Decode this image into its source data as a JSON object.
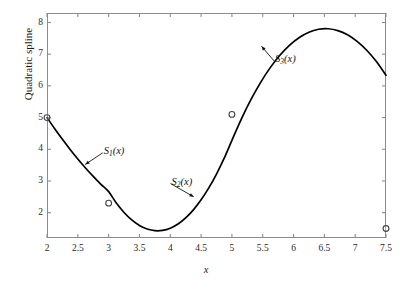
{
  "chart_data": {
    "type": "line",
    "title": "",
    "subtitle": "",
    "xlabel": "x",
    "ylabel": "Quadratic spline",
    "xlim": [
      2,
      7.5
    ],
    "ylim": [
      1.2,
      8.3
    ],
    "grid": false,
    "legend": null,
    "x_ticks": [
      "2",
      "2.5",
      "3",
      "3.5",
      "4",
      "4.5",
      "5",
      "5.5",
      "6",
      "6.5",
      "7",
      "7.5"
    ],
    "x_tick_values": [
      2,
      2.5,
      3,
      3.5,
      4,
      4.5,
      5,
      5.5,
      6,
      6.5,
      7,
      7.5
    ],
    "y_ticks": [
      "2",
      "3",
      "4",
      "5",
      "6",
      "7",
      "8"
    ],
    "y_tick_values": [
      2,
      3,
      4,
      5,
      6,
      7,
      8
    ],
    "series": [
      {
        "name": "Quadratic spline curve",
        "type": "line",
        "color": "#000000",
        "x": [
          2.0,
          2.125,
          2.25,
          2.375,
          2.5,
          2.625,
          2.75,
          2.875,
          3.0,
          3.125,
          3.25,
          3.375,
          3.5,
          3.625,
          3.75,
          3.875,
          4.0,
          4.125,
          4.25,
          4.375,
          4.5,
          4.625,
          4.75,
          4.875,
          5.0,
          5.15625,
          5.3125,
          5.46875,
          5.625,
          5.78125,
          5.9375,
          6.09375,
          6.25,
          6.40625,
          6.5625,
          6.71875,
          6.875,
          7.03125,
          7.1875,
          7.34375,
          7.5
        ],
        "y": [
          5.0,
          4.6477,
          4.3125,
          3.9945,
          3.6938,
          3.4102,
          3.1438,
          2.8945,
          2.6625,
          2.3037,
          2.0063,
          1.7702,
          1.5953,
          1.4818,
          1.4296,
          1.4387,
          1.5091,
          1.6408,
          1.8338,
          2.0881,
          2.4037,
          2.7806,
          3.2188,
          3.7183,
          4.2791,
          4.9672,
          5.5807,
          6.1196,
          6.5839,
          6.9736,
          7.2887,
          7.5292,
          7.6951,
          7.7864,
          7.8031,
          7.7452,
          7.6127,
          7.4056,
          7.1239,
          6.7676,
          6.3367
        ]
      },
      {
        "name": "Interpolation knots",
        "type": "scatter",
        "marker": "open-circle",
        "color": "#444444",
        "points": [
          {
            "x": 2.0,
            "y": 5.0
          },
          {
            "x": 3.0,
            "y": 2.3
          },
          {
            "x": 5.0,
            "y": 5.1
          },
          {
            "x": 7.5,
            "y": 1.5
          }
        ]
      }
    ],
    "annotations": [
      {
        "label": "S1(x)",
        "text_main": "S",
        "text_sub": "1",
        "text_tail": "(x)",
        "x": 2.92,
        "y": 3.92,
        "arrow_to_x": 2.62,
        "arrow_to_y": 3.52
      },
      {
        "label": "S2(x)",
        "text_main": "S",
        "text_sub": "2",
        "text_tail": "(x)",
        "x": 4.02,
        "y": 2.95,
        "arrow_to_x": 4.38,
        "arrow_to_y": 2.5
      },
      {
        "label": "S3(x)",
        "text_main": "S",
        "text_sub": "3",
        "text_tail": "(x)",
        "x": 5.7,
        "y": 6.82,
        "arrow_to_x": 5.48,
        "arrow_to_y": 7.25
      }
    ]
  },
  "figure": {
    "background_color": "#ffffff",
    "axis_color": "#8c8c8c",
    "curve_color": "#000000",
    "marker_edge_color": "#444444",
    "text_color": "#1a1a1a"
  }
}
